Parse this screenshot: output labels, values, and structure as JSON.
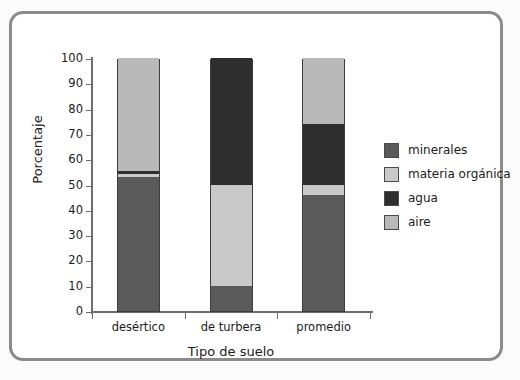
{
  "chart_data": {
    "type": "bar",
    "subtype": "stacked-bar-100-percent",
    "title": "",
    "xlabel": "Tipo de suelo",
    "ylabel": "Porcentaje",
    "ylim": [
      0,
      100
    ],
    "yticks": [
      0,
      10,
      20,
      30,
      40,
      50,
      60,
      70,
      80,
      90,
      100
    ],
    "ytick_labels": [
      "0",
      "10",
      "20",
      "30",
      "40",
      "50",
      "60",
      "70",
      "80",
      "90",
      "100"
    ],
    "grid": false,
    "legend_position": "right",
    "categories": [
      "desértico",
      "de turbera",
      "promedio"
    ],
    "series": [
      {
        "name": "minerales",
        "color": "#5a5a5a",
        "values": [
          53,
          10,
          46
        ]
      },
      {
        "name": "materia orgánica",
        "color": "#c9c9c9",
        "values": [
          1,
          40,
          4
        ]
      },
      {
        "name": "agua",
        "color": "#2e2e2e",
        "values": [
          1.5,
          50,
          24
        ]
      },
      {
        "name": "aire",
        "color": "#b9b9b9",
        "values": [
          44.5,
          0,
          26
        ]
      }
    ],
    "stack_order_bottom_to_top": [
      "minerales",
      "materia orgánica",
      "agua",
      "aire"
    ],
    "annotations": []
  },
  "legend": {
    "entries": [
      {
        "label": "minerales",
        "color": "#5a5a5a"
      },
      {
        "label": "materia orgánica",
        "color": "#c9c9c9"
      },
      {
        "label": "agua",
        "color": "#2e2e2e"
      },
      {
        "label": "aire",
        "color": "#b9b9b9"
      }
    ]
  },
  "axes": {
    "y_title": "Porcentaje",
    "x_title": "Tipo de suelo"
  },
  "colors": {
    "frame_border": "#8b8b8b",
    "axis": "#6e6e6e",
    "bar_outline": "#3d3d3d",
    "text": "#1b1b1b",
    "background": "#ffffff"
  }
}
